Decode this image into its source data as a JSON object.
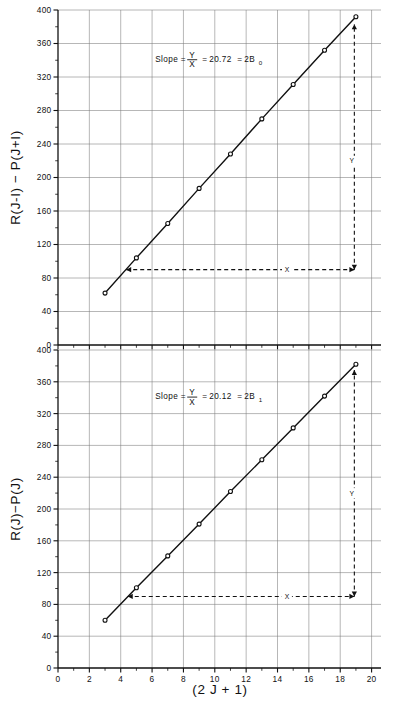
{
  "figure": {
    "xlabel": "(2 J + 1)",
    "panels": [
      {
        "id": "top",
        "ylabel": "R(J-I) − P(J+I)",
        "annotation": {
          "prefix": "Slope =",
          "numerator": "Y",
          "denominator": "X",
          "equals1": "=",
          "value": "20.72",
          "equals2": "=",
          "result_main": "2B",
          "result_sub": "0"
        },
        "construction": {
          "x_label": "X",
          "y_label": "Y"
        }
      },
      {
        "id": "bottom",
        "ylabel": "R(J)−P(J)",
        "annotation": {
          "prefix": "Slope =",
          "numerator": "Y",
          "denominator": "X",
          "equals1": "=",
          "value": "20.12",
          "equals2": "=",
          "result_main": "2B",
          "result_sub": "1"
        },
        "construction": {
          "x_label": "X",
          "y_label": "Y"
        }
      }
    ]
  },
  "chart_data": [
    {
      "type": "scatter",
      "panel": "top",
      "title": "",
      "xlabel": "(2 J + 1)",
      "ylabel": "R(J-I) - P(J+I)",
      "xlim": [
        0,
        20.6
      ],
      "ylim": [
        0,
        400
      ],
      "grid": true,
      "legend": null,
      "xticks": [
        0,
        2,
        4,
        6,
        8,
        10,
        12,
        14,
        16,
        18,
        20
      ],
      "xticklabels": [
        "0",
        "2",
        "4",
        "6",
        "8",
        "10",
        "12",
        "14",
        "16",
        "18",
        "20"
      ],
      "xminor_step": 1,
      "yticks": [
        0,
        40,
        80,
        120,
        160,
        200,
        240,
        280,
        320,
        360,
        400
      ],
      "yticklabels": [
        "0",
        "40",
        "80",
        "120",
        "160",
        "200",
        "240",
        "280",
        "320",
        "360",
        "400"
      ],
      "yminor_step": 20,
      "x": [
        3,
        5,
        7,
        9,
        11,
        13,
        15,
        17,
        19
      ],
      "y": [
        62,
        104,
        145,
        187,
        228,
        270,
        311,
        352,
        392
      ],
      "fit": {
        "slope": 20.72,
        "intercept": 0.0,
        "label": "Slope = Y/X = 20.72 = 2B0"
      },
      "annotations": [
        {
          "text": "Slope = Y/X = 20.72 = 2B0",
          "x": 8.0,
          "y": 340
        },
        {
          "text": "X",
          "x": 14.6,
          "y": 90,
          "role": "construction-horizontal"
        },
        {
          "text": "Y",
          "x": 18.4,
          "y": 220,
          "role": "construction-vertical"
        }
      ],
      "construction_lines": {
        "horizontal": {
          "y": 90,
          "x_from": 4.35,
          "x_to": 18.9
        },
        "vertical": {
          "x": 18.9,
          "y_from": 90,
          "y_to": 383
        }
      }
    },
    {
      "type": "scatter",
      "panel": "bottom",
      "title": "",
      "xlabel": "(2 J + 1)",
      "ylabel": "R(J)-P(J)",
      "xlim": [
        0,
        20.6
      ],
      "ylim": [
        0,
        400
      ],
      "grid": true,
      "legend": null,
      "xticks": [
        0,
        2,
        4,
        6,
        8,
        10,
        12,
        14,
        16,
        18,
        20
      ],
      "xticklabels": [
        "0",
        "2",
        "4",
        "6",
        "8",
        "10",
        "12",
        "14",
        "16",
        "18",
        "20"
      ],
      "xminor_step": 1,
      "yticks": [
        0,
        40,
        80,
        120,
        160,
        200,
        240,
        280,
        320,
        360,
        400
      ],
      "yticklabels": [
        "0",
        "40",
        "80",
        "120",
        "160",
        "200",
        "240",
        "280",
        "320",
        "360",
        "400"
      ],
      "yminor_step": 20,
      "x": [
        3,
        5,
        7,
        9,
        11,
        13,
        15,
        17,
        19
      ],
      "y": [
        60,
        101,
        141,
        181,
        222,
        262,
        302,
        342,
        382
      ],
      "fit": {
        "slope": 20.12,
        "intercept": 0.0,
        "label": "Slope = Y/X = 20.12 = 2B1"
      },
      "annotations": [
        {
          "text": "Slope = Y/X = 20.12 = 2B1",
          "x": 8.0,
          "y": 340
        },
        {
          "text": "X",
          "x": 14.6,
          "y": 90,
          "role": "construction-horizontal"
        },
        {
          "text": "Y",
          "x": 18.4,
          "y": 220,
          "role": "construction-vertical"
        }
      ],
      "construction_lines": {
        "horizontal": {
          "y": 90,
          "x_from": 4.45,
          "x_to": 18.9
        },
        "vertical": {
          "x": 18.9,
          "y_from": 90,
          "y_to": 375
        }
      }
    }
  ]
}
